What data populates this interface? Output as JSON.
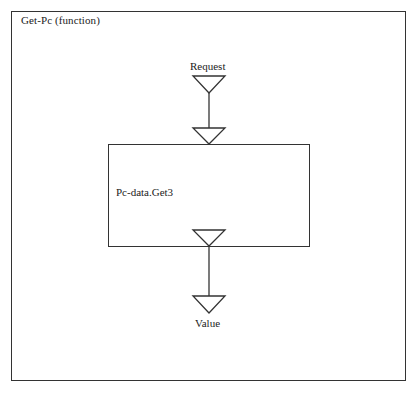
{
  "diagram": {
    "frame_title": "Get-Pc (function)",
    "process_label": "Pc-data.Get3",
    "input_port_label": "Request",
    "output_port_label": "Value",
    "icons": {
      "input_triangle": "down-triangle-port",
      "process_in_triangle": "down-triangle-port",
      "process_out_triangle": "down-triangle-port",
      "output_triangle": "down-triangle-port"
    },
    "colors": {
      "line": "#333333",
      "background": "#ffffff"
    }
  }
}
